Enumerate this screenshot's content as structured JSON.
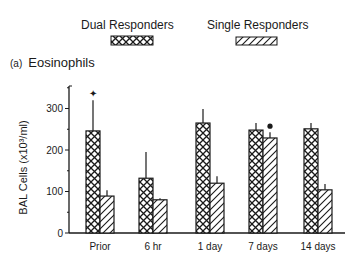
{
  "legend": {
    "dual_label": "Dual Responders",
    "single_label": "Single Responders"
  },
  "panel": {
    "tag": "(a)",
    "title": "Eosinophils"
  },
  "colors": {
    "ink": "#1a1a1a",
    "background": "#ffffff"
  },
  "chart_data": {
    "type": "bar",
    "title": "Eosinophils",
    "panel_label": "(a)",
    "xlabel": "",
    "ylabel": "BAL Cells (x10^3/ml)",
    "ylabel_display": "BAL Cells (x10³/ml)",
    "ylim": [
      0,
      350
    ],
    "yticks": [
      0,
      100,
      200,
      300
    ],
    "grid": false,
    "legend_position": "top",
    "categories": [
      "Prior",
      "6 hr",
      "1 day",
      "7 days",
      "14 days"
    ],
    "series": [
      {
        "name": "Dual Responders",
        "pattern": "crosshatch",
        "values": [
          246,
          132,
          265,
          248,
          251
        ],
        "error_upper": [
          320,
          195,
          299,
          265,
          265
        ]
      },
      {
        "name": "Single Responders",
        "pattern": "diagonal-hatch",
        "values": [
          89,
          80,
          120,
          229,
          104
        ],
        "error_upper": [
          103,
          84,
          137,
          243,
          118
        ]
      }
    ],
    "annotations": [
      {
        "category": "Prior",
        "series": "Dual Responders",
        "symbol": "✦",
        "meaning": "significance marker"
      },
      {
        "category": "7 days",
        "series": "Single Responders",
        "symbol": "●",
        "meaning": "significance marker"
      }
    ]
  }
}
